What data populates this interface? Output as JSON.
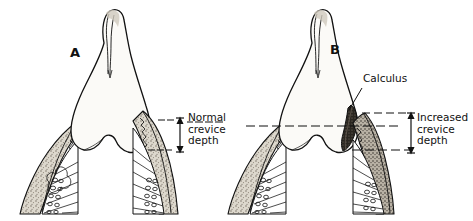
{
  "figure": {
    "background_color": "#ffffff",
    "ink_color": "#111111",
    "gingiva_fill": "#d8d2c6",
    "calculus_color": "#1a1a1a",
    "enamel_fill": "#fbfaf7"
  },
  "panels": [
    {
      "letter": "A",
      "description": "Tooth with healthy gingiva and normal crevice depth"
    },
    {
      "letter": "B",
      "description": "Tooth with calculus deposit and increased crevice depth"
    }
  ],
  "annotations": {
    "calculus": {
      "label": "Calculus"
    },
    "normal_depth": {
      "line1": "Normal",
      "line2": "crevice",
      "line3": "depth"
    },
    "increased_depth": {
      "line1": "Increased",
      "line2": "crevice",
      "line3": "depth"
    }
  }
}
